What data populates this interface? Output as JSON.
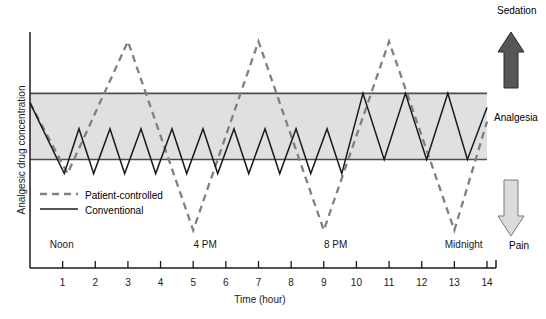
{
  "chart_data": {
    "type": "line",
    "title": "",
    "xlabel": "Time (hour)",
    "ylabel": "Analgesic drug concentration",
    "xlim": [
      0,
      14
    ],
    "ylim": [
      0,
      100
    ],
    "grid": false,
    "legend_position": "lower-left",
    "xticks": [
      "1",
      "2",
      "3",
      "4",
      "5",
      "6",
      "7",
      "8",
      "9",
      "10",
      "11",
      "12",
      "13",
      "14"
    ],
    "xtick_values": [
      1,
      2,
      3,
      4,
      5,
      6,
      7,
      8,
      9,
      10,
      11,
      12,
      13,
      14
    ],
    "time_of_day_labels": [
      {
        "text": "Noon",
        "hour": 0.3
      },
      {
        "text": "4 PM",
        "hour": 4.7
      },
      {
        "text": "8 PM",
        "hour": 8.7
      },
      {
        "text": "Midnight",
        "hour": 12.4
      }
    ],
    "therapeutic_band": {
      "label": "Analgesia",
      "upper": 74,
      "lower": 46,
      "fill_color": "#e0e0e0",
      "edge_color": "#4d4d4d"
    },
    "annotations": [
      {
        "text": "Sedation",
        "position": "top-right",
        "arrow": "up",
        "arrow_color": "#4a4a4a"
      },
      {
        "text": "Analgesia",
        "position": "middle-right",
        "arrow": "none"
      },
      {
        "text": "Pain",
        "position": "bottom-right",
        "arrow": "down",
        "arrow_color": "#d9d9d9"
      }
    ],
    "series": [
      {
        "name": "Patient-controlled",
        "style": "dashed",
        "color": "#808080",
        "points": [
          [
            0.0,
            70
          ],
          [
            1.15,
            40
          ],
          [
            3.0,
            96
          ],
          [
            5.0,
            16
          ],
          [
            7.0,
            96
          ],
          [
            9.0,
            16
          ],
          [
            11.0,
            96
          ],
          [
            13.0,
            16
          ],
          [
            14.0,
            62
          ]
        ]
      },
      {
        "name": "Conventional",
        "style": "solid",
        "color": "#1a1a1a",
        "points": [
          [
            0.0,
            70
          ],
          [
            1.05,
            40
          ],
          [
            1.5,
            59
          ],
          [
            1.95,
            40
          ],
          [
            2.45,
            59
          ],
          [
            2.9,
            40
          ],
          [
            3.4,
            59
          ],
          [
            3.85,
            40
          ],
          [
            4.35,
            59
          ],
          [
            4.8,
            40
          ],
          [
            5.3,
            59
          ],
          [
            5.75,
            40
          ],
          [
            6.25,
            59
          ],
          [
            6.7,
            40
          ],
          [
            7.2,
            59
          ],
          [
            7.65,
            40
          ],
          [
            8.15,
            59
          ],
          [
            8.6,
            40
          ],
          [
            9.1,
            59
          ],
          [
            9.55,
            40
          ],
          [
            10.2,
            74
          ],
          [
            10.85,
            46
          ],
          [
            11.5,
            74
          ],
          [
            12.15,
            46
          ],
          [
            12.8,
            74
          ],
          [
            13.4,
            46
          ],
          [
            14.0,
            68
          ]
        ]
      }
    ]
  },
  "legend": {
    "items": [
      {
        "label": "Patient-controlled",
        "style": "dashed"
      },
      {
        "label": "Conventional",
        "style": "solid"
      }
    ]
  }
}
